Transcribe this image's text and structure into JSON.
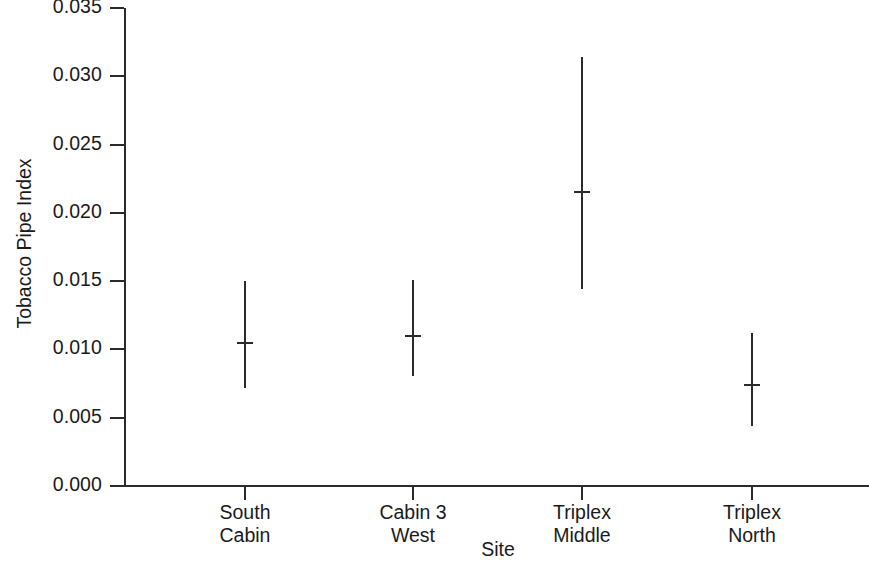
{
  "chart_data": {
    "type": "scatter",
    "title": "",
    "xlabel": "Site",
    "ylabel": "Tobacco Pipe Index",
    "categories": [
      "South Cabin",
      "Cabin 3 West",
      "Triplex Middle",
      "Triplex North"
    ],
    "category_lines": [
      [
        "South",
        "Cabin"
      ],
      [
        "Cabin 3",
        "West"
      ],
      [
        "Triplex",
        "Middle"
      ],
      [
        "Triplex",
        "North"
      ]
    ],
    "ylim": [
      0.0,
      0.035
    ],
    "yticks": [
      0.0,
      0.005,
      0.01,
      0.015,
      0.02,
      0.025,
      0.03,
      0.035
    ],
    "ytick_labels": [
      "0.000",
      "0.005",
      "0.010",
      "0.015",
      "0.020",
      "0.025",
      "0.030",
      "0.035"
    ],
    "grid": false,
    "legend": null,
    "series": [
      {
        "name": "Tobacco Pipe Index",
        "values": [
          0.0105,
          0.011,
          0.0215,
          0.0074
        ],
        "lower": [
          0.0072,
          0.0081,
          0.0144,
          0.0044
        ],
        "upper": [
          0.015,
          0.0151,
          0.0314,
          0.0112
        ],
        "marker": "horizontal-dash",
        "color": "#2b2b2b"
      }
    ]
  },
  "axes": {
    "y_title": "Tobacco Pipe Index",
    "x_title": "Site"
  },
  "colors": {
    "ink": "#2b2b2b",
    "background": "#ffffff"
  }
}
